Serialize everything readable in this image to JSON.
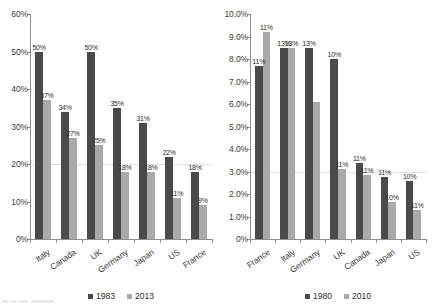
{
  "chart_data": [
    {
      "id": "left",
      "type": "bar",
      "title": "",
      "xlabel": "",
      "ylabel": "",
      "categories": [
        "Italy",
        "Canada",
        "UK",
        "Germany",
        "Japan",
        "US",
        "France"
      ],
      "ylim": [
        0,
        60
      ],
      "ytick_labels": [
        "60%",
        "50%",
        "40%",
        "30%",
        "20%",
        "10%",
        "0%"
      ],
      "ytick_values": [
        60,
        50,
        40,
        30,
        20,
        10,
        0
      ],
      "grid": true,
      "legend_position": "bottom-center",
      "series": [
        {
          "name": "1983",
          "color": "#4a4a4a",
          "values": [
            50,
            34,
            50,
            35,
            31,
            22,
            18
          ],
          "labels": [
            "50%",
            "34%",
            "50%",
            "35%",
            "31%",
            "22%",
            "18%"
          ]
        },
        {
          "name": "2013",
          "color": "#a9a9a9",
          "values": [
            37,
            27,
            25,
            18,
            18,
            11,
            9
          ],
          "labels": [
            "37%",
            "27%",
            "25%",
            "18%",
            "18%",
            "11%",
            "9%"
          ]
        }
      ]
    },
    {
      "id": "right",
      "type": "bar",
      "title": "",
      "xlabel": "",
      "ylabel": "",
      "categories": [
        "France",
        "Italy",
        "Germany",
        "UK",
        "Canada",
        "Japan",
        "US"
      ],
      "ylim": [
        0,
        10
      ],
      "ytick_labels": [
        "10.0%",
        "9.0%",
        "8.0%",
        "7.0%",
        "6.0%",
        "5.0%",
        "4.0%",
        "3.0%",
        "2.0%",
        "1.0%",
        "0%"
      ],
      "ytick_values": [
        10,
        9,
        8,
        7,
        6,
        5,
        4,
        3,
        2,
        1,
        0
      ],
      "grid": true,
      "legend_position": "bottom-center",
      "series": [
        {
          "name": "1980",
          "color": "#4a4a4a",
          "values": [
            7.7,
            8.5,
            8.5,
            8.0,
            3.4,
            2.75,
            2.6
          ],
          "labels": [
            "11%",
            "13%",
            "13%",
            "10%",
            "11%",
            "11%",
            "10%"
          ]
        },
        {
          "name": "2010",
          "color": "#a9a9a9",
          "values": [
            9.2,
            8.5,
            6.1,
            3.1,
            2.85,
            1.65,
            1.3
          ],
          "labels": [
            "11%",
            "13%",
            "",
            "11%",
            "11%",
            "10%",
            "11%"
          ]
        }
      ]
    }
  ]
}
